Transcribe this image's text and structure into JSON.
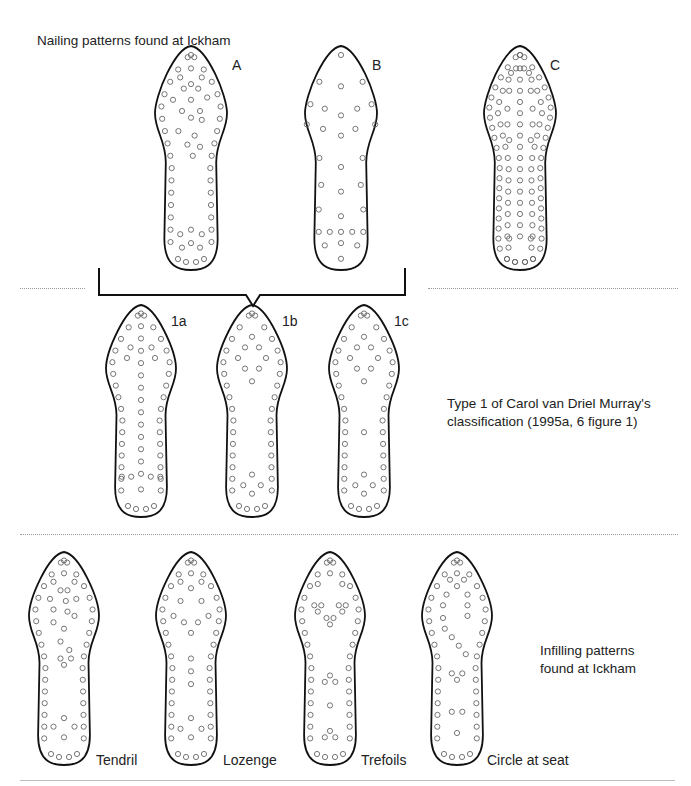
{
  "title": "Nailing patterns found at Ickham",
  "rows": [
    {
      "name": "ickham-patterns",
      "soles": [
        {
          "id": "A",
          "label": "A",
          "cx": 191,
          "top": 46,
          "bottom": 270,
          "w": 72,
          "pattern": "dense-A"
        },
        {
          "id": "B",
          "label": "B",
          "cx": 341,
          "top": 46,
          "bottom": 270,
          "w": 72,
          "pattern": "sparse-B"
        },
        {
          "id": "C",
          "label": "C",
          "cx": 520,
          "top": 46,
          "bottom": 270,
          "w": 72,
          "pattern": "dense-C"
        }
      ]
    },
    {
      "name": "type1-classification",
      "soles": [
        {
          "id": "1a",
          "label": "1a",
          "cx": 141,
          "top": 305,
          "bottom": 517,
          "w": 70,
          "pattern": "1a"
        },
        {
          "id": "1b",
          "label": "1b",
          "cx": 252,
          "top": 305,
          "bottom": 517,
          "w": 70,
          "pattern": "1b"
        },
        {
          "id": "1c",
          "label": "1c",
          "cx": 364,
          "top": 305,
          "bottom": 517,
          "w": 70,
          "pattern": "1c"
        }
      ]
    },
    {
      "name": "infilling-patterns",
      "soles": [
        {
          "id": "tendril",
          "label": "Tendril",
          "cx": 64,
          "top": 552,
          "bottom": 765,
          "w": 70,
          "pattern": "tendril"
        },
        {
          "id": "lozenge",
          "label": "Lozenge",
          "cx": 191,
          "top": 552,
          "bottom": 765,
          "w": 70,
          "pattern": "lozenge"
        },
        {
          "id": "trefoils",
          "label": "Trefoils",
          "cx": 330,
          "top": 552,
          "bottom": 765,
          "w": 70,
          "pattern": "trefoils"
        },
        {
          "id": "circle",
          "label": "Circle at seat",
          "cx": 457,
          "top": 552,
          "bottom": 765,
          "w": 70,
          "pattern": "circle"
        }
      ]
    }
  ],
  "captions": {
    "type1_line1": "Type 1 of Carol van Driel Murray's",
    "type1_line2": "classification (1995a, 6 figure 1)",
    "infill_line1": "Infilling patterns",
    "infill_line2": "found at Ickham"
  },
  "labels": {
    "A": "A",
    "B": "B",
    "C": "C",
    "1a": "1a",
    "1b": "1b",
    "1c": "1c",
    "tendril": "Tendril",
    "lozenge": "Lozenge",
    "trefoils": "Trefoils",
    "circle": "Circle at seat"
  },
  "colors": {
    "outline": "#111111",
    "nail": "#666666",
    "divider": "#9a9a9a",
    "rule": "#bdbdbd"
  }
}
